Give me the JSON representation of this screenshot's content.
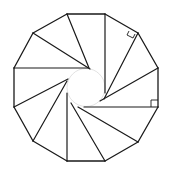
{
  "diagram": {
    "title": "",
    "shape": "regular dodecagon",
    "sides": 12,
    "spiral_segments": 12,
    "right_angle_markers": 2,
    "stroke_color": "#1a1a1a",
    "background_color": "#ffffff"
  }
}
